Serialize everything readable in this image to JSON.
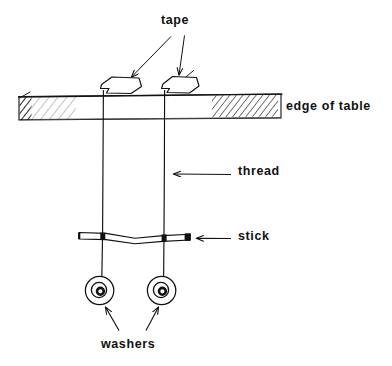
{
  "diagram": {
    "labels": {
      "tape": "tape",
      "edge_of_table": "edge  of  table",
      "thread": "thread",
      "stick": "stick",
      "washers": "washers"
    },
    "colors": {
      "ink": "#111111",
      "background": "#ffffff",
      "hatch": "#333333"
    },
    "parts": [
      {
        "name": "tape",
        "count": 2,
        "label": "tape"
      },
      {
        "name": "table",
        "count": 1,
        "label": "edge  of  table"
      },
      {
        "name": "thread",
        "count": 2,
        "label": "thread"
      },
      {
        "name": "stick",
        "count": 1,
        "label": "stick"
      },
      {
        "name": "washer",
        "count": 2,
        "label": "washers"
      }
    ]
  }
}
